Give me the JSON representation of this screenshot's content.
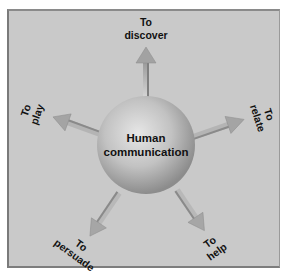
{
  "diagram": {
    "type": "hub-and-spoke",
    "center": {
      "line1": "Human",
      "line2": "communication"
    },
    "spokes": [
      {
        "id": "discover",
        "direction": "up",
        "line1": "To",
        "line2": "discover"
      },
      {
        "id": "relate",
        "direction": "right",
        "line1": "To",
        "line2": "relate"
      },
      {
        "id": "help",
        "direction": "down-right",
        "line1": "To",
        "line2": "help"
      },
      {
        "id": "persuade",
        "direction": "down-left",
        "line1": "To",
        "line2": "persuade"
      },
      {
        "id": "play",
        "direction": "left",
        "line1": "To",
        "line2": "play"
      }
    ],
    "colors": {
      "background": "#c9c9c9",
      "sphere_light": "#e4e4e4",
      "sphere_dark": "#8e8e8e",
      "arrow": "#a8a8a8",
      "text": "#111111"
    }
  }
}
